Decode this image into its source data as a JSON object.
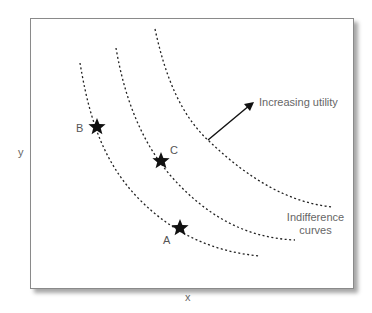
{
  "diagram": {
    "axes": {
      "x_label": "x",
      "y_label": "y"
    },
    "annotations": {
      "arrow_label": "Increasing utility",
      "curves_label_line1": "Indifference",
      "curves_label_line2": "curves"
    },
    "points": [
      {
        "label": "A",
        "curve": 1
      },
      {
        "label": "B",
        "curve": 1
      },
      {
        "label": "C",
        "curve": 2
      }
    ],
    "curves": [
      {
        "id": 1,
        "style": "dashed"
      },
      {
        "id": 2,
        "style": "dashed"
      },
      {
        "id": 3,
        "style": "dashed"
      }
    ],
    "colors": {
      "line": "#222222",
      "text": "#666666",
      "star": "#111111",
      "frame": "#8a8a8a"
    }
  }
}
